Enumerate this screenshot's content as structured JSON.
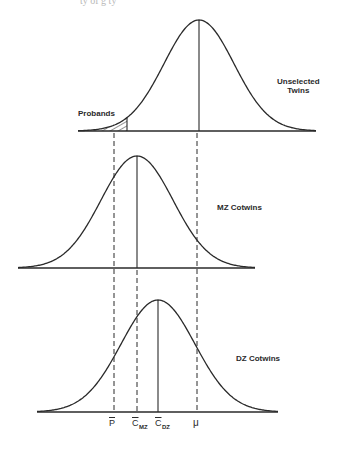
{
  "figure": {
    "top_cut_text": "ty  of  g    ty",
    "panels": [
      {
        "id": "unselected",
        "label_line1": "Unselected",
        "label_line2": "Twins",
        "mean_x": 199,
        "peak_y": 20,
        "baseline_y": 131,
        "sigma": 35,
        "x_start": 78,
        "x_end": 316,
        "tail_label": "Probands",
        "threshold_x": 127
      },
      {
        "id": "mz",
        "label": "MZ Cotwins",
        "mean_x": 137,
        "peak_y": 156,
        "baseline_y": 268,
        "sigma": 36,
        "x_start": 18,
        "x_end": 255
      },
      {
        "id": "dz",
        "label": "DZ Cotwins",
        "mean_x": 158,
        "peak_y": 300,
        "baseline_y": 412,
        "sigma": 37,
        "x_start": 37,
        "x_end": 278
      }
    ],
    "reference_lines": [
      {
        "name": "P-bar",
        "x": 114,
        "from_y": 133,
        "to_y": 412
      },
      {
        "name": "mu",
        "x": 197,
        "from_y": 133,
        "to_y": 412
      },
      {
        "name": "C-bar-MZ",
        "x": 137,
        "from_y": 270,
        "to_y": 412
      }
    ],
    "axis_labels": {
      "p_bar": "P",
      "c_mz_main": "C",
      "c_mz_sub": "MZ",
      "c_dz_main": "C",
      "c_dz_sub": "DZ",
      "mu": "μ"
    },
    "colors": {
      "line": "#2a2a2a",
      "background": "#ffffff"
    }
  }
}
